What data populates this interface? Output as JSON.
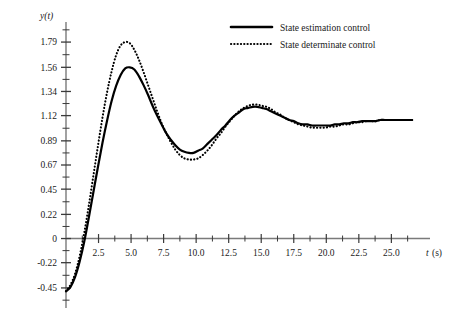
{
  "chart_data": {
    "type": "line",
    "title": "",
    "xlabel": "t (s)",
    "ylabel": "y(t)",
    "xlim": [
      0,
      27.2
    ],
    "ylim": [
      -0.56,
      1.9
    ],
    "grid": false,
    "legend_position": "top-center",
    "x_ticks": [
      2.5,
      5.0,
      7.5,
      10.0,
      12.5,
      15.0,
      17.5,
      20.0,
      22.5,
      25.0
    ],
    "x_tick_labels": [
      "2.5",
      "5.0",
      "7.5",
      "10.0",
      "12.5",
      "15.0",
      "17.5",
      "20.0",
      "22.5",
      "25.0"
    ],
    "x_minor_step": 1.25,
    "y_ticks": [
      1.79,
      1.56,
      1.34,
      1.12,
      0.89,
      0.67,
      0.45,
      0.22,
      0,
      -0.22,
      -0.45
    ],
    "y_tick_labels": [
      "1.79",
      "1.56",
      "1.34",
      "1.12",
      "0.89",
      "0.67",
      "0.45",
      "0.22",
      "0",
      "-0.22",
      "-0.45"
    ],
    "y_minor_step": 0.1115,
    "series": [
      {
        "name": "State estimation control",
        "style": "solid",
        "color": "#000000",
        "x": [
          0.0,
          0.35,
          0.7,
          1.05,
          1.4,
          1.75,
          2.1,
          2.45,
          2.8,
          3.15,
          3.5,
          3.85,
          4.2,
          4.55,
          4.9,
          5.25,
          5.6,
          5.95,
          6.3,
          6.65,
          7.0,
          7.35,
          7.7,
          8.05,
          8.4,
          8.75,
          9.1,
          9.45,
          9.8,
          10.15,
          10.5,
          10.85,
          11.2,
          11.55,
          11.9,
          12.25,
          12.6,
          12.95,
          13.3,
          13.65,
          14.0,
          14.35,
          14.7,
          15.05,
          15.4,
          15.75,
          16.1,
          16.45,
          16.8,
          17.15,
          17.5,
          17.85,
          18.2,
          18.55,
          18.9,
          19.25,
          19.6,
          19.95,
          20.3,
          20.65,
          21.0,
          21.35,
          21.7,
          22.05,
          22.4,
          22.75,
          23.1,
          23.45,
          23.8,
          24.15,
          24.5,
          24.85,
          25.2,
          25.55,
          25.9,
          26.25,
          26.6
        ],
        "y": [
          -0.48,
          -0.44,
          -0.35,
          -0.21,
          -0.03,
          0.19,
          0.42,
          0.65,
          0.87,
          1.07,
          1.25,
          1.39,
          1.49,
          1.55,
          1.56,
          1.54,
          1.48,
          1.4,
          1.31,
          1.21,
          1.12,
          1.04,
          0.96,
          0.9,
          0.85,
          0.81,
          0.79,
          0.78,
          0.78,
          0.8,
          0.82,
          0.86,
          0.9,
          0.94,
          0.99,
          1.03,
          1.08,
          1.12,
          1.15,
          1.18,
          1.19,
          1.2,
          1.2,
          1.19,
          1.18,
          1.16,
          1.14,
          1.12,
          1.1,
          1.08,
          1.07,
          1.05,
          1.04,
          1.04,
          1.03,
          1.03,
          1.03,
          1.03,
          1.03,
          1.04,
          1.04,
          1.05,
          1.05,
          1.06,
          1.06,
          1.07,
          1.07,
          1.07,
          1.07,
          1.08,
          1.08,
          1.08,
          1.08,
          1.08,
          1.08,
          1.08,
          1.08
        ]
      },
      {
        "name": "State determinate control",
        "style": "dotted",
        "color": "#000000",
        "x": [
          0.0,
          0.35,
          0.7,
          1.05,
          1.4,
          1.75,
          2.1,
          2.45,
          2.8,
          3.15,
          3.5,
          3.85,
          4.2,
          4.55,
          4.9,
          5.25,
          5.6,
          5.95,
          6.3,
          6.65,
          7.0,
          7.35,
          7.7,
          8.05,
          8.4,
          8.75,
          9.1,
          9.45,
          9.8,
          10.15,
          10.5,
          10.85,
          11.2,
          11.55,
          11.9,
          12.25,
          12.6,
          12.95,
          13.3,
          13.65,
          14.0,
          14.35,
          14.7,
          15.05,
          15.4,
          15.75,
          16.1,
          16.45,
          16.8,
          17.15,
          17.5,
          17.85,
          18.2,
          18.55,
          18.9,
          19.25,
          19.6,
          19.95,
          20.3,
          20.65,
          21.0,
          21.35,
          21.7,
          22.05,
          22.4,
          22.75,
          23.1,
          23.45,
          23.8,
          24.15,
          24.5,
          24.85,
          25.2,
          25.55,
          25.9,
          26.25,
          26.6
        ],
        "y": [
          -0.48,
          -0.42,
          -0.32,
          -0.16,
          0.05,
          0.3,
          0.57,
          0.84,
          1.1,
          1.33,
          1.52,
          1.67,
          1.76,
          1.79,
          1.78,
          1.72,
          1.63,
          1.52,
          1.4,
          1.28,
          1.16,
          1.05,
          0.96,
          0.88,
          0.81,
          0.76,
          0.73,
          0.72,
          0.72,
          0.73,
          0.76,
          0.8,
          0.85,
          0.91,
          0.96,
          1.02,
          1.07,
          1.12,
          1.16,
          1.19,
          1.21,
          1.22,
          1.22,
          1.21,
          1.2,
          1.18,
          1.15,
          1.13,
          1.1,
          1.08,
          1.06,
          1.04,
          1.03,
          1.02,
          1.01,
          1.01,
          1.01,
          1.01,
          1.02,
          1.02,
          1.03,
          1.04,
          1.04,
          1.05,
          1.06,
          1.06,
          1.07,
          1.07,
          1.07,
          1.08,
          1.08,
          1.08,
          1.08,
          1.08,
          1.08,
          1.08,
          1.08
        ]
      }
    ],
    "legend": [
      {
        "label": "State estimation control",
        "style": "solid"
      },
      {
        "label": "State determinate control",
        "style": "dotted"
      }
    ]
  }
}
